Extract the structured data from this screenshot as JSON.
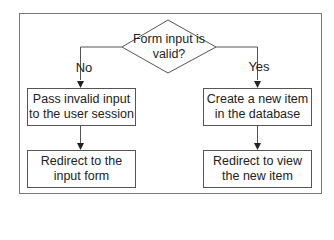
{
  "decision": {
    "text": "Form input is\nvalid?"
  },
  "branches": {
    "no_label": "No",
    "yes_label": "Yes"
  },
  "left_column": {
    "step1": "Pass invalid input\nto the user session",
    "step2": "Redirect to the\ninput form"
  },
  "right_column": {
    "step1": "Create a new item\nin the database",
    "step2": "Redirect to view\nthe new item"
  },
  "colors": {
    "line": "#555555",
    "frame": "#777777",
    "background": "#ffffff",
    "text": "#222222"
  }
}
